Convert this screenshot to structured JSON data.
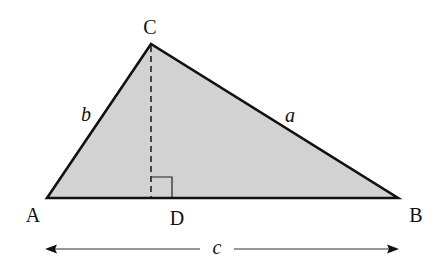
{
  "figure": {
    "colors": {
      "fill": "#d2d2d2",
      "stroke": "#111111",
      "background": "#ffffff"
    },
    "vertices": {
      "A": {
        "label": "A",
        "x": 47,
        "y": 198
      },
      "B": {
        "label": "B",
        "x": 398,
        "y": 198
      },
      "C": {
        "label": "C",
        "x": 151,
        "y": 44
      },
      "D": {
        "label": "D",
        "x": 151,
        "y": 198
      }
    },
    "sides": {
      "a": "a",
      "b": "b",
      "c": "c"
    },
    "altitude": {
      "from": "C",
      "to": "D",
      "style": "dashed"
    },
    "right_angle_marker": {
      "at": "D"
    },
    "base_dimension": {
      "label": "c",
      "from": "A",
      "to": "B",
      "arrows": "both"
    }
  }
}
